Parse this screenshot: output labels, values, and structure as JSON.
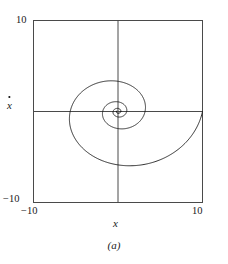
{
  "figure": {
    "caption": "(a)",
    "axis_labels": {
      "x": "x",
      "y": "x"
    },
    "ticks": {
      "y_max": "10",
      "y_min": "−10",
      "x_min": "−10",
      "x_max": "10"
    },
    "colors": {
      "line": "#1a1a1a",
      "frame": "#4a4a4a",
      "axis": "#4a4a4a",
      "background": "#ffffff"
    }
  },
  "chart_data": {
    "type": "line",
    "title": "",
    "subtitle": "",
    "xlabel": "x",
    "ylabel": "xdot",
    "xlim": [
      -10,
      10
    ],
    "ylim": [
      -10,
      10
    ],
    "grid": false,
    "legend": null,
    "annotations": [],
    "axes_style": {
      "frame": "box",
      "zero_lines": true,
      "xticks": [
        -10,
        10
      ],
      "yticks": [
        -10,
        10
      ],
      "xticklabels": [
        "−10",
        "10"
      ],
      "yticklabels": [
        "−10",
        "10"
      ]
    },
    "model": {
      "kind": "damped_oscillator_spiral",
      "start_point": [
        10,
        0
      ],
      "end_point": [
        0,
        0
      ],
      "decay_per_revolution": 0.32,
      "initial_angle_deg": 0,
      "turns": 3.6,
      "aspect_x": 1.0,
      "aspect_y": 0.78
    },
    "series": [
      {
        "name": "trajectory",
        "x": [
          10.0,
          9.62,
          8.98,
          8.12,
          7.06,
          5.87,
          4.58,
          3.25,
          1.93,
          0.67,
          -0.47,
          -1.46,
          -2.28,
          -2.9,
          -3.32,
          -3.54,
          -3.58,
          -3.44,
          -3.15,
          -2.74,
          -2.24,
          -1.68,
          -1.09,
          -0.51,
          0.04,
          0.54,
          0.97,
          1.31,
          1.55,
          1.7,
          1.75,
          1.71,
          1.6,
          1.42,
          1.19,
          0.93,
          0.65,
          0.37,
          0.1,
          -0.15,
          -0.37,
          -0.55,
          -0.68,
          -0.77,
          -0.81,
          -0.81,
          -0.76,
          -0.69,
          -0.59,
          -0.47,
          -0.34,
          -0.21,
          -0.08,
          0.04,
          0.15,
          0.24,
          0.31,
          0.36,
          0.39,
          0.39,
          0.38,
          0.35,
          0.3,
          0.25,
          0.19,
          0.12,
          0.06,
          0.0,
          -0.05,
          -0.09,
          -0.13,
          -0.15,
          -0.17,
          -0.17,
          -0.17,
          -0.15,
          -0.13,
          -0.11,
          -0.08,
          -0.05,
          -0.02,
          0.0,
          0.02,
          0.04,
          0.06,
          0.07,
          0.07,
          0.07,
          0.07,
          0.06,
          0.05,
          0.04,
          0.02,
          0.01,
          0.0,
          -0.01,
          -0.02,
          -0.02,
          -0.03,
          -0.03,
          0.0
        ],
        "y": [
          0.0,
          -1.93,
          -3.67,
          -5.12,
          -6.23,
          -6.96,
          -7.3,
          -7.27,
          -6.91,
          -6.26,
          -5.39,
          -4.37,
          -3.28,
          -2.17,
          -1.12,
          -0.17,
          0.65,
          1.31,
          1.81,
          2.14,
          2.31,
          2.33,
          2.22,
          2.0,
          1.7,
          1.34,
          0.95,
          0.55,
          0.16,
          -0.19,
          -0.5,
          -0.76,
          -0.95,
          -1.08,
          -1.14,
          -1.14,
          -1.09,
          -1.0,
          -0.87,
          -0.71,
          -0.54,
          -0.36,
          -0.18,
          -0.01,
          0.14,
          0.27,
          0.38,
          0.45,
          0.5,
          0.52,
          0.51,
          0.48,
          0.43,
          0.36,
          0.28,
          0.2,
          0.12,
          0.04,
          -0.04,
          -0.1,
          -0.15,
          -0.19,
          -0.22,
          -0.23,
          -0.23,
          -0.22,
          -0.2,
          -0.17,
          -0.14,
          -0.1,
          -0.06,
          -0.02,
          0.01,
          0.04,
          0.07,
          0.09,
          0.1,
          0.11,
          0.11,
          0.1,
          0.09,
          0.08,
          0.06,
          0.04,
          0.02,
          0.01,
          -0.01,
          -0.02,
          -0.03,
          -0.04,
          -0.04,
          -0.04,
          -0.04,
          -0.04,
          -0.03,
          -0.02,
          -0.02,
          -0.01,
          0.0,
          0.0,
          0.0
        ]
      }
    ]
  }
}
